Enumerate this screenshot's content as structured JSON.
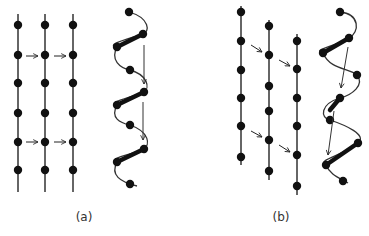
{
  "colors": {
    "ink": "#111111",
    "line": "#333333",
    "background": "#ffffff"
  },
  "panels": [
    {
      "id": "a",
      "caption": "(a)",
      "caption_pos": [
        84,
        210
      ],
      "chains": [
        {
          "x": 18,
          "y1": 14,
          "y2": 192,
          "dots": [
            25,
            55,
            83,
            113,
            142,
            170
          ]
        },
        {
          "x": 45,
          "y1": 14,
          "y2": 192,
          "dots": [
            25,
            55,
            83,
            113,
            142,
            170
          ]
        },
        {
          "x": 73,
          "y1": 14,
          "y2": 192,
          "dots": [
            25,
            55,
            83,
            113,
            142,
            170
          ]
        }
      ],
      "shift_arrows": [
        {
          "from": [
            26,
            56
          ],
          "to": [
            38,
            56
          ]
        },
        {
          "from": [
            54,
            56
          ],
          "to": [
            66,
            56
          ]
        },
        {
          "from": [
            26,
            142
          ],
          "to": [
            38,
            142
          ]
        },
        {
          "from": [
            54,
            142
          ],
          "to": [
            66,
            142
          ]
        }
      ],
      "helix": {
        "path": "M129,12 C150,18 150,32 143,34 C125,40 105,45 117,47 C110,60 120,68 130,70 C148,75 150,88 144,92 C130,98 108,102 117,105 C110,118 120,123 130,125 C150,132 150,145 144,149 C130,155 108,158 117,162 C110,175 120,182 137,186",
        "dots": [
          [
            129,
            12
          ],
          [
            143,
            34
          ],
          [
            117,
            47
          ],
          [
            130,
            70
          ],
          [
            144,
            92
          ],
          [
            117,
            105
          ],
          [
            130,
            125
          ],
          [
            144,
            149
          ],
          [
            117,
            162
          ],
          [
            130,
            184
          ]
        ],
        "bonds": [
          [
            [
              117,
              47
            ],
            [
              143,
              34
            ]
          ],
          [
            [
              117,
              105
            ],
            [
              144,
              92
            ]
          ],
          [
            [
              117,
              162
            ],
            [
              144,
              149
            ]
          ]
        ],
        "arrows": [
          {
            "from": [
              144,
              45
            ],
            "to": [
              144,
              84
            ]
          },
          {
            "from": [
              143,
              102
            ],
            "to": [
              143,
              140
            ]
          }
        ]
      }
    },
    {
      "id": "b",
      "caption": "(b)",
      "caption_pos": [
        281,
        210
      ],
      "chains": [
        {
          "x": 241,
          "y1": 6,
          "y2": 165,
          "dots": [
            12,
            41,
            70,
            98,
            126,
            157
          ]
        },
        {
          "x": 269,
          "y1": 20,
          "y2": 180,
          "dots": [
            26,
            55,
            86,
            111,
            140,
            171
          ]
        },
        {
          "x": 297,
          "y1": 34,
          "y2": 195,
          "dots": [
            41,
            69,
            98,
            126,
            155,
            186
          ]
        }
      ],
      "shift_arrows": [
        {
          "from": [
            251,
            45
          ],
          "to": [
            262,
            52
          ]
        },
        {
          "from": [
            279,
            60
          ],
          "to": [
            290,
            66
          ]
        },
        {
          "from": [
            251,
            131
          ],
          "to": [
            262,
            137
          ]
        },
        {
          "from": [
            279,
            145
          ],
          "to": [
            290,
            152
          ]
        }
      ],
      "helix": {
        "path": "M340,12 C360,14 360,32 349,38 C330,48 312,50 323,53 C330,70 350,68 357,75 C365,85 352,95 340,98 C320,104 320,118 330,120 C345,125 368,135 358,143 C345,155 315,160 326,165 C330,175 340,178 348,183",
        "dots": [
          [
            340,
            12
          ],
          [
            349,
            38
          ],
          [
            323,
            53
          ],
          [
            357,
            75
          ],
          [
            340,
            98
          ],
          [
            330,
            120
          ],
          [
            358,
            143
          ],
          [
            326,
            165
          ],
          [
            343,
            181
          ]
        ],
        "bonds": [
          [
            [
              323,
              53
            ],
            [
              349,
              38
            ]
          ],
          [
            [
              330,
              110
            ],
            [
              340,
              98
            ]
          ],
          [
            [
              326,
              165
            ],
            [
              358,
              143
            ]
          ]
        ],
        "arrows": [
          {
            "from": [
              348,
              47
            ],
            "to": [
              341,
              88
            ]
          },
          {
            "from": [
              334,
              111
            ],
            "to": [
              328,
              155
            ]
          }
        ]
      }
    }
  ]
}
